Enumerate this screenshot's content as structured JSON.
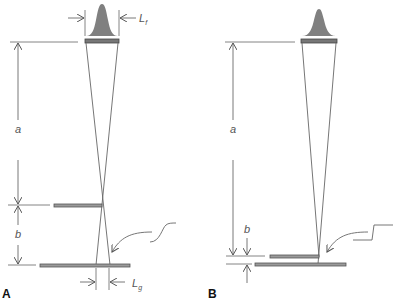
{
  "panels": [
    {
      "id": "A",
      "label": "A",
      "dimension_labels": {
        "a": "a",
        "b": "b",
        "source_width": "L",
        "source_width_sub": "f",
        "blur_width": "L",
        "blur_width_sub": "g"
      },
      "description": "Focal spot projection with object far from detector: large geometric unsharpness"
    },
    {
      "id": "B",
      "label": "B",
      "dimension_labels": {
        "a": "a",
        "b": "b"
      },
      "description": "Focal spot projection with object close to detector: small geometric unsharpness"
    }
  ],
  "colors": {
    "line": "#666666",
    "fill": "#808080",
    "bar_fill": "#9a9a9a",
    "bar_stroke": "#555555",
    "text": "#555555"
  }
}
